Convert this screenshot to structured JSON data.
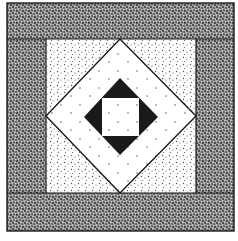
{
  "figure": {
    "colors": {
      "background": "#ffffff",
      "ink": "#1a1a1a",
      "dense_stipple": "#2a2a2a",
      "light_stipple": "#555555"
    },
    "regions": [
      {
        "id": "top-band",
        "fill": "dense-stipple"
      },
      {
        "id": "bottom-band",
        "fill": "dense-stipple"
      },
      {
        "id": "left-band",
        "fill": "dense-stipple"
      },
      {
        "id": "right-band",
        "fill": "dense-stipple"
      },
      {
        "id": "center-square",
        "fill": "light-stipple"
      },
      {
        "id": "white-diamond",
        "fill": "white-sparse-dots"
      },
      {
        "id": "black-diamond",
        "fill": "solid-black"
      },
      {
        "id": "inner-square",
        "fill": "white-sparse-dots"
      }
    ]
  }
}
